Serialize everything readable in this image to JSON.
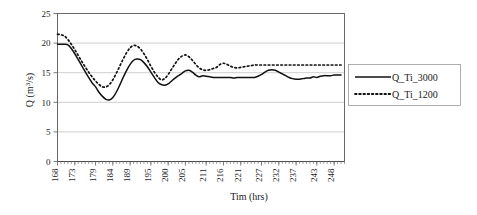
{
  "chart_data": {
    "type": "line",
    "title": "",
    "xlabel": "Tim (hrs)",
    "ylabel": "Q (m3/s)",
    "ylabel_display": "Q (m³/s)",
    "xlim": [
      168,
      251
    ],
    "ylim": [
      0,
      25
    ],
    "ytick_values": [
      0,
      5,
      10,
      15,
      20,
      25
    ],
    "ytick_labels": [
      "0",
      "5",
      "10",
      "15",
      "20",
      "25"
    ],
    "xtick_labels": [
      "168",
      "173",
      "179",
      "184",
      "189",
      "195",
      "200",
      "205",
      "211",
      "216",
      "221",
      "227",
      "232",
      "237",
      "243",
      "248"
    ],
    "xtick_values": [
      168,
      173,
      179,
      184,
      189,
      195,
      200,
      205,
      211,
      216,
      221,
      227,
      232,
      237,
      243,
      248
    ],
    "grid": "horizontal",
    "legend_position": "right-outside",
    "series": [
      {
        "name": "Q_Ti_3000",
        "style": "solid",
        "color": "#111111",
        "x": [
          168,
          169,
          170,
          171,
          172,
          173,
          174,
          175,
          176,
          177,
          178,
          179,
          180,
          181,
          182,
          183,
          184,
          185,
          186,
          187,
          188,
          189,
          190,
          191,
          192,
          193,
          194,
          195,
          196,
          197,
          198,
          199,
          200,
          201,
          202,
          203,
          204,
          205,
          206,
          207,
          208,
          209,
          210,
          211,
          212,
          213,
          214,
          215,
          216,
          217,
          218,
          219,
          220,
          221,
          222,
          223,
          224,
          225,
          226,
          227,
          228,
          229,
          230,
          231,
          232,
          233,
          234,
          235,
          236,
          237,
          238,
          239,
          240,
          241,
          242,
          243,
          244,
          245,
          246,
          247,
          248,
          249,
          250
        ],
        "values": [
          19.8,
          19.8,
          19.8,
          19.7,
          19.1,
          18.2,
          17.2,
          16.2,
          15.2,
          14.2,
          13.3,
          12.6,
          11.7,
          11.0,
          10.5,
          10.4,
          10.8,
          11.7,
          12.9,
          14.2,
          15.4,
          16.4,
          17.1,
          17.3,
          17.2,
          16.7,
          16.0,
          15.1,
          14.2,
          13.4,
          13.0,
          12.9,
          13.1,
          13.6,
          14.1,
          14.5,
          14.9,
          15.3,
          15.4,
          15.1,
          14.6,
          14.3,
          14.5,
          14.4,
          14.3,
          14.2,
          14.2,
          14.2,
          14.2,
          14.2,
          14.2,
          14.1,
          14.2,
          14.2,
          14.2,
          14.2,
          14.2,
          14.2,
          14.4,
          14.7,
          15.1,
          15.4,
          15.5,
          15.4,
          15.1,
          14.8,
          14.5,
          14.2,
          14.0,
          13.9,
          13.9,
          14.0,
          14.1,
          14.1,
          14.3,
          14.2,
          14.4,
          14.5,
          14.5,
          14.5,
          14.6,
          14.6,
          14.6
        ]
      },
      {
        "name": "Q_Ti_1200",
        "style": "dotted",
        "color": "#111111",
        "x": [
          168,
          169,
          170,
          171,
          172,
          173,
          174,
          175,
          176,
          177,
          178,
          179,
          180,
          181,
          182,
          183,
          184,
          185,
          186,
          187,
          188,
          189,
          190,
          191,
          192,
          193,
          194,
          195,
          196,
          197,
          198,
          199,
          200,
          201,
          202,
          203,
          204,
          205,
          206,
          207,
          208,
          209,
          210,
          211,
          212,
          213,
          214,
          215,
          216,
          217,
          218,
          219,
          220,
          221,
          222,
          223,
          224,
          225,
          226,
          227,
          228,
          229,
          230,
          231,
          232,
          233,
          234,
          235,
          236,
          237,
          238,
          239,
          240,
          241,
          242,
          243,
          244,
          245,
          246,
          247,
          248,
          249,
          250
        ],
        "values": [
          21.5,
          21.4,
          21.2,
          20.6,
          19.8,
          18.9,
          17.9,
          16.9,
          16.0,
          15.1,
          14.3,
          13.6,
          13.0,
          12.6,
          12.6,
          13.0,
          13.8,
          14.9,
          16.1,
          17.3,
          18.4,
          19.2,
          19.6,
          19.5,
          19.0,
          18.2,
          17.2,
          16.1,
          15.1,
          14.3,
          13.8,
          14.0,
          14.7,
          15.6,
          16.5,
          17.3,
          17.8,
          18.0,
          17.7,
          17.1,
          16.4,
          15.8,
          15.5,
          15.4,
          15.5,
          15.7,
          15.9,
          16.4,
          16.6,
          16.4,
          16.1,
          15.9,
          15.8,
          15.9,
          16.0,
          16.1,
          16.2,
          16.3,
          16.3,
          16.3,
          16.3,
          16.3,
          16.3,
          16.3,
          16.3,
          16.3,
          16.3,
          16.3,
          16.3,
          16.3,
          16.3,
          16.3,
          16.3,
          16.3,
          16.3,
          16.3,
          16.3,
          16.3,
          16.3,
          16.3,
          16.3,
          16.3,
          16.3
        ]
      }
    ]
  },
  "legend": {
    "entries": [
      {
        "label": "Q_Ti_3000"
      },
      {
        "label": "Q_Ti_1200"
      }
    ]
  }
}
